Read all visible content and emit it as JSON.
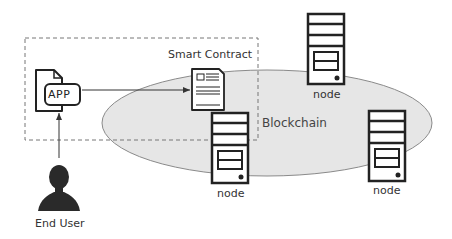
{
  "diagram": {
    "labels": {
      "smart_contract": "Smart Contract",
      "blockchain": "Blockchain",
      "app": "APP",
      "end_user": "End User",
      "node_top": "node",
      "node_bottom_left": "node",
      "node_bottom_right": "node"
    },
    "nodes": [
      {
        "id": "node-top",
        "label": "node"
      },
      {
        "id": "node-bottom-left",
        "label": "node"
      },
      {
        "id": "node-bottom-right",
        "label": "node"
      }
    ],
    "edges": [
      {
        "from": "End User",
        "to": "APP"
      },
      {
        "from": "APP",
        "to": "Smart Contract"
      }
    ],
    "colors": {
      "ellipse_fill": "#e6e6e6",
      "ellipse_stroke": "#8a8a8a",
      "stroke": "#222222",
      "dashed_box": "#777777",
      "text": "#333333"
    }
  }
}
